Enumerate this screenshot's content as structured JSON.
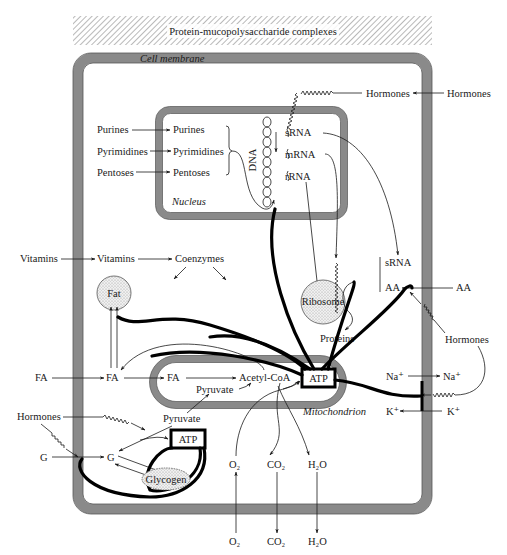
{
  "title": "Protein-mucopolysaccharide complexes",
  "compartments": {
    "cell_membrane": "Cell membrane",
    "nucleus": "Nucleus",
    "mitochondrion": "Mitochondrion",
    "dna": "DNA"
  },
  "nucleus_inputs": {
    "outside": [
      "Purines",
      "Pyrimidines",
      "Pentoses"
    ],
    "inside": [
      "Purines",
      "Pyrimidines",
      "Pentoses"
    ]
  },
  "rna": [
    "sRNA",
    "mRNA",
    "rRNA"
  ],
  "hormones": {
    "top_outside": "Hormones",
    "top_inside": "Hormones",
    "right": "Hormones",
    "left": "Hormones"
  },
  "vitamins": {
    "outside": "Vitamins",
    "inside": "Vitamins",
    "product": "Coenzymes"
  },
  "fat": "Fat",
  "ribosome": "Ribosome",
  "proteins": "Proteins",
  "trna_group": {
    "srna": "sRNA",
    "aa_inside": "AA"
  },
  "aa_outside": "AA",
  "fatty_acids": {
    "outside": "FA",
    "cytosol": "FA",
    "mito": "FA"
  },
  "acetyl_coa": "Acetyl-CoA",
  "pyruvate": {
    "mito": "Pyruvate",
    "cytosol": "Pyruvate"
  },
  "atp": {
    "mito": "ATP",
    "cytosol": "ATP"
  },
  "ions": {
    "na_inside": "Na⁺",
    "na_outside": "Na⁺",
    "k_inside": "K⁺",
    "k_outside": "K⁺"
  },
  "glucose": {
    "outside": "G",
    "inside": "G"
  },
  "glycogen": "Glycogen",
  "gases": {
    "o2_inside": "O₂",
    "o2_outside": "O₂",
    "co2_inside": "CO₂",
    "co2_outside": "CO₂",
    "h2o_inside": "H₂O",
    "h2o_outside": "H₂O"
  },
  "colors": {
    "membrane": "#8a8a8a",
    "membrane_edge": "#555555",
    "organelle_fill": "#e6e6e6",
    "ink": "#1a1a1a"
  }
}
